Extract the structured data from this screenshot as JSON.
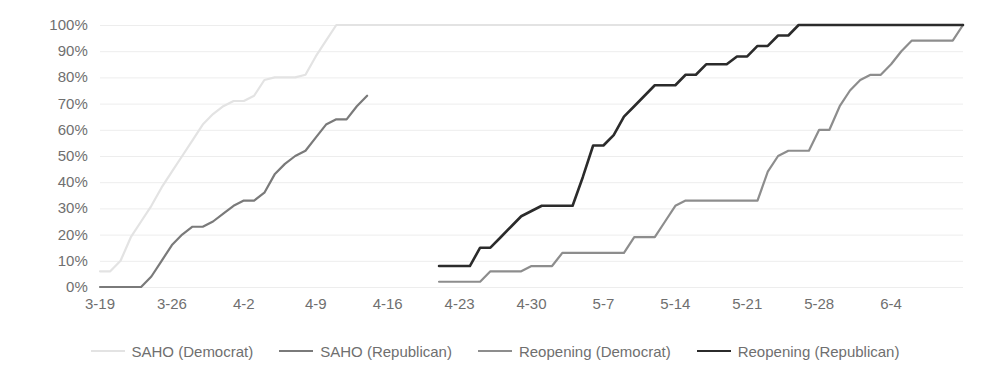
{
  "chart_data": {
    "type": "line",
    "title": "",
    "xlabel": "",
    "ylabel": "",
    "grid": true,
    "legend_position": "bottom",
    "ylim": [
      0,
      100
    ],
    "ytick_labels": [
      "100%",
      "90%",
      "80%",
      "70%",
      "60%",
      "50%",
      "40%",
      "30%",
      "20%",
      "10%",
      "0%"
    ],
    "ytick_values": [
      100,
      90,
      80,
      70,
      60,
      50,
      40,
      30,
      20,
      10,
      0
    ],
    "xtick_labels": [
      "3-19",
      "3-26",
      "4-2",
      "4-9",
      "4-16",
      "4-23",
      "4-30",
      "5-7",
      "5-14",
      "5-21",
      "5-28",
      "6-4"
    ],
    "xlim_days": [
      0,
      84
    ],
    "xtick_days": [
      0,
      7,
      14,
      21,
      28,
      35,
      42,
      49,
      56,
      63,
      70,
      77
    ],
    "series": [
      {
        "name": "SAHO (Democrat)",
        "color": "#e3e3e3",
        "width": 2.2,
        "x": [
          0,
          1,
          2,
          3,
          4,
          5,
          6,
          7,
          8,
          9,
          10,
          11,
          12,
          13,
          14,
          15,
          16,
          17,
          18,
          19,
          20,
          21,
          22,
          23,
          84
        ],
        "y": [
          6,
          6,
          10,
          19,
          25,
          31,
          38,
          44,
          50,
          56,
          62,
          66,
          69,
          71,
          71,
          73,
          79,
          80,
          80,
          80,
          81,
          88,
          94,
          100,
          100
        ]
      },
      {
        "name": "SAHO (Republican)",
        "color": "#7a7a7a",
        "width": 2.2,
        "x": [
          0,
          1,
          2,
          3,
          4,
          5,
          6,
          7,
          8,
          9,
          10,
          11,
          12,
          13,
          14,
          15,
          16,
          17,
          18,
          19,
          20,
          21,
          22,
          23,
          24,
          25,
          26
        ],
        "y": [
          0,
          0,
          0,
          0,
          0,
          4,
          10,
          16,
          20,
          23,
          23,
          25,
          28,
          31,
          33,
          33,
          36,
          43,
          47,
          50,
          52,
          57,
          62,
          64,
          64,
          69,
          73
        ]
      },
      {
        "name": "Reopening (Democrat)",
        "color": "#8d8d8d",
        "width": 2.2,
        "x": [
          33,
          34,
          35,
          36,
          37,
          38,
          39,
          40,
          41,
          42,
          43,
          44,
          45,
          46,
          47,
          48,
          49,
          50,
          51,
          52,
          53,
          54,
          55,
          56,
          57,
          58,
          59,
          60,
          61,
          62,
          63,
          64,
          65,
          66,
          67,
          68,
          69,
          70,
          71,
          72,
          73,
          74,
          75,
          76,
          77,
          78,
          79,
          80,
          81,
          82,
          83,
          84
        ],
        "y": [
          2,
          2,
          2,
          2,
          2,
          6,
          6,
          6,
          6,
          8,
          8,
          8,
          13,
          13,
          13,
          13,
          13,
          13,
          13,
          19,
          19,
          19,
          25,
          31,
          33,
          33,
          33,
          33,
          33,
          33,
          33,
          33,
          44,
          50,
          52,
          52,
          52,
          60,
          60,
          69,
          75,
          79,
          81,
          81,
          85,
          90,
          94,
          94,
          94,
          94,
          94,
          100
        ]
      },
      {
        "name": "Reopening (Republican)",
        "color": "#2b2b2b",
        "width": 2.6,
        "x": [
          33,
          34,
          35,
          36,
          37,
          38,
          39,
          40,
          41,
          42,
          43,
          44,
          45,
          46,
          47,
          48,
          49,
          50,
          51,
          52,
          53,
          54,
          55,
          56,
          57,
          58,
          59,
          60,
          61,
          62,
          63,
          64,
          65,
          66,
          67,
          68,
          69,
          70,
          71,
          72,
          73,
          74,
          75,
          76,
          77,
          78,
          79,
          80,
          81,
          82,
          83,
          84
        ],
        "y": [
          8,
          8,
          8,
          8,
          15,
          15,
          19,
          23,
          27,
          29,
          31,
          31,
          31,
          31,
          42,
          54,
          54,
          58,
          65,
          69,
          73,
          77,
          77,
          77,
          81,
          81,
          85,
          85,
          85,
          88,
          88,
          92,
          92,
          96,
          96,
          100,
          100,
          100,
          100,
          100,
          100,
          100,
          100,
          100,
          100,
          100,
          100,
          100,
          100,
          100,
          100,
          100
        ]
      }
    ]
  },
  "legend": {
    "items": [
      {
        "label": "SAHO (Democrat)"
      },
      {
        "label": "SAHO (Republican)"
      },
      {
        "label": "Reopening (Democrat)"
      },
      {
        "label": "Reopening (Republican)"
      }
    ]
  },
  "colors": {
    "gridline": "#ededed",
    "axis_text": "#6f6f6f",
    "background": "#ffffff"
  }
}
